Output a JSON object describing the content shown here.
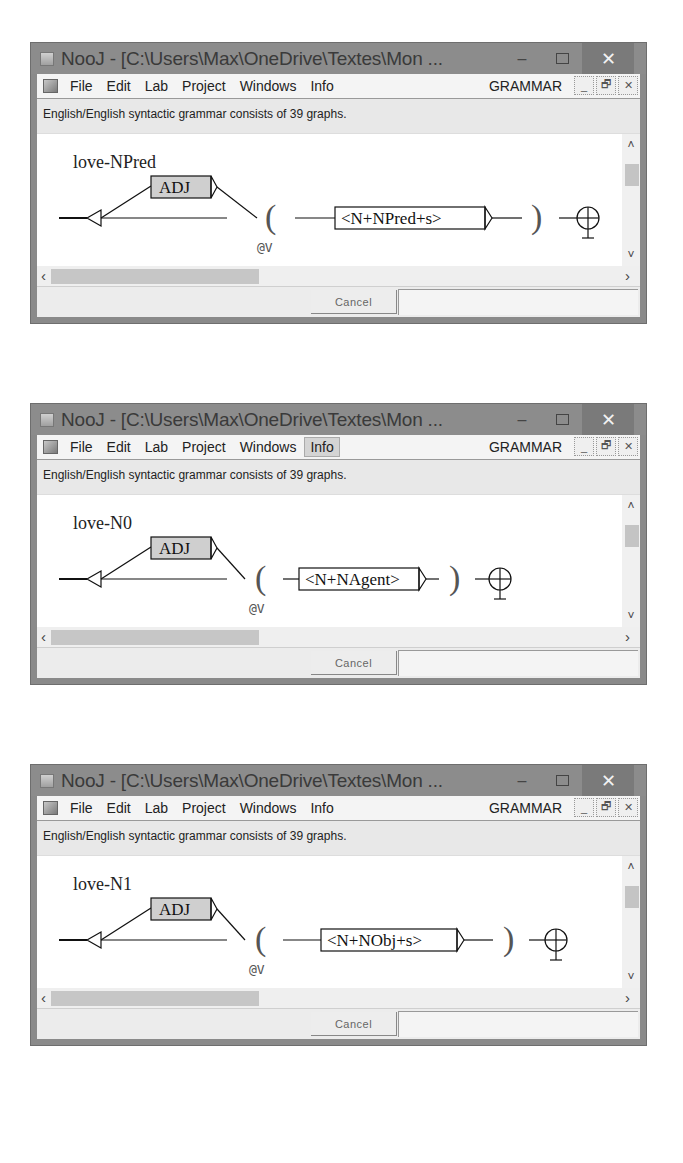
{
  "windows": [
    {
      "title": "NooJ - [C:\\Users\\Max\\OneDrive\\Textes\\Mon ...",
      "menu": [
        "File",
        "Edit",
        "Lab",
        "Project",
        "Windows",
        "Info"
      ],
      "active_menu": null,
      "grammar_label": "GRAMMAR",
      "status": "English/English syntactic grammar consists of 39 graphs.",
      "graph": {
        "title": "love-NPred",
        "optional_node": "ADJ",
        "open_paren": "(",
        "variable": "@V",
        "main_node": "<N+NPred+s>",
        "close_paren": ")"
      },
      "cancel_label": "Cancel"
    },
    {
      "title": "NooJ - [C:\\Users\\Max\\OneDrive\\Textes\\Mon ...",
      "menu": [
        "File",
        "Edit",
        "Lab",
        "Project",
        "Windows",
        "Info"
      ],
      "active_menu": "Info",
      "grammar_label": "GRAMMAR",
      "status": "English/English syntactic grammar consists of 39 graphs.",
      "graph": {
        "title": "love-N0",
        "optional_node": "ADJ",
        "open_paren": "(",
        "variable": "@V",
        "main_node": "<N+NAgent>",
        "close_paren": ")"
      },
      "cancel_label": "Cancel"
    },
    {
      "title": "NooJ - [C:\\Users\\Max\\OneDrive\\Textes\\Mon ...",
      "menu": [
        "File",
        "Edit",
        "Lab",
        "Project",
        "Windows",
        "Info"
      ],
      "active_menu": null,
      "grammar_label": "GRAMMAR",
      "status": "English/English syntactic grammar consists of 39 graphs.",
      "graph": {
        "title": "love-N1",
        "optional_node": "ADJ",
        "open_paren": "(",
        "variable": "@V",
        "main_node": "<N+NObj+s>",
        "close_paren": ")"
      },
      "cancel_label": "Cancel"
    }
  ],
  "icons": {
    "minimize": "–",
    "close": "✕",
    "mdi_minimize": "_",
    "mdi_restore": "🗗",
    "mdi_close": "✕",
    "scroll_up": "˄",
    "scroll_down": "˅",
    "scroll_left": "‹",
    "scroll_right": "›"
  }
}
